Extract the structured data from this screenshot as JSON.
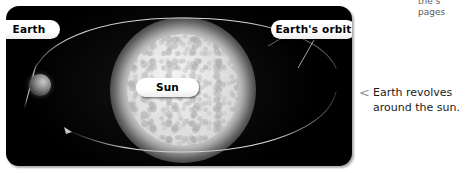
{
  "clipped_sidebar_text": {
    "line1": "the s",
    "line2": "pages"
  },
  "illustration": {
    "callouts": {
      "earth": "Earth",
      "earth_orbit": "Earth's orbit",
      "sun": "Sun"
    },
    "objects": {
      "sun_label": "sun-sphere",
      "earth_label": "earth-sphere",
      "orbit_label": "earth-orbit-ellipse",
      "axis_label": "earth-axis-line"
    },
    "colors": {
      "panel_background": "#000000",
      "sun_fill": "#e2e2e2",
      "callout_fill": "#ffffff",
      "callout_text": "#000000"
    }
  },
  "caption": {
    "marker": "<",
    "line1": "Earth revolves",
    "line2": "around the sun."
  }
}
